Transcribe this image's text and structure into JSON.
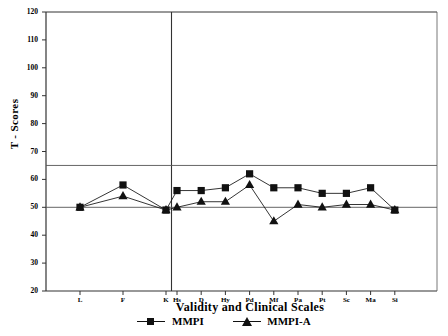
{
  "chart_data": {
    "type": "line",
    "title": "",
    "xlabel": "Validity and Clinical Scales",
    "ylabel": "T - Scores",
    "ylim": [
      20,
      120
    ],
    "yticks": [
      20,
      30,
      40,
      50,
      60,
      70,
      80,
      90,
      100,
      110,
      120
    ],
    "grid": false,
    "reference_lines": [
      {
        "value": 65,
        "orientation": "horizontal",
        "label": ""
      },
      {
        "value": 50,
        "orientation": "horizontal",
        "label": ""
      }
    ],
    "panel_divider_after_category": "K",
    "categories": [
      "L",
      "F",
      "K",
      "Hs",
      "D",
      "Hy",
      "Pd",
      "Mf",
      "Pa",
      "Pt",
      "Sc",
      "Ma",
      "Si"
    ],
    "legend_position": "bottom",
    "series": [
      {
        "name": "MMPI",
        "marker": "square",
        "color": "#111111",
        "values": [
          50,
          58,
          49,
          56,
          56,
          57,
          62,
          57,
          57,
          55,
          55,
          57,
          49
        ]
      },
      {
        "name": "MMPI-A",
        "marker": "triangle",
        "color": "#111111",
        "values": [
          50,
          54,
          49,
          50,
          52,
          52,
          58,
          45,
          51,
          50,
          51,
          51,
          49
        ]
      }
    ]
  },
  "axes": {
    "y_title": "T - Scores",
    "x_title": "Validity and Clinical Scales",
    "y_tick_labels": [
      "120",
      "110",
      "100",
      "90",
      "80",
      "70",
      "60",
      "50",
      "40",
      "30",
      "20"
    ],
    "x_tick_labels": [
      "L",
      "F",
      "K",
      "Hs",
      "D",
      "Hy",
      "Pd",
      "Mf",
      "Pa",
      "Pt",
      "Sc",
      "Ma",
      "Si"
    ]
  },
  "legend": {
    "items": [
      {
        "label": "MMPI",
        "marker": "square"
      },
      {
        "label": "MMPI-A",
        "marker": "triangle"
      }
    ]
  },
  "colors": {
    "line": "#111111",
    "axis": "#000000",
    "reference": "#555555",
    "background": "#ffffff"
  }
}
